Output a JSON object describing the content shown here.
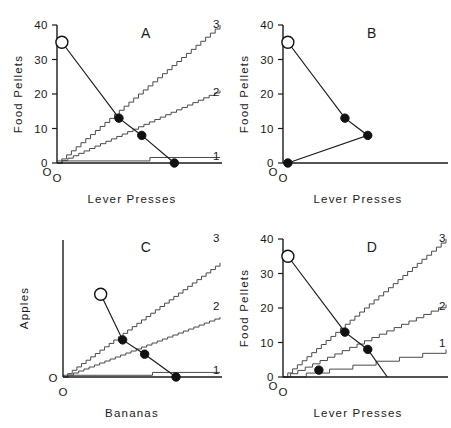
{
  "figure": {
    "colors": {
      "axis": "#1a1a1a",
      "schedule_line": "#4a4a4a",
      "demand_line": "#1a1a1a",
      "point_fill": "#111111",
      "point_open_fill": "#ffffff",
      "background": "#ffffff"
    }
  },
  "chart_data": [
    {
      "type": "line",
      "panel": "A",
      "title": "A",
      "xlabel": "Lever Presses",
      "ylabel": "Food Pellets",
      "yticks": [
        0,
        10,
        20,
        30,
        40
      ],
      "ylim": [
        0,
        40
      ],
      "xlim": [
        0,
        100
      ],
      "grid": false,
      "legend": "none",
      "origin_label": "O",
      "series": [
        {
          "name": "demand curve",
          "style": "line-with-markers",
          "x": [
            3,
            38,
            52,
            72
          ],
          "y": [
            35,
            13,
            8,
            0
          ],
          "markers": [
            "open",
            "filled",
            "filled",
            "filled"
          ]
        },
        {
          "name": "ratio schedule 3",
          "label": "3",
          "style": "staircase",
          "slope": 0.4,
          "x_end": 100,
          "y_end": 40
        },
        {
          "name": "ratio schedule 2",
          "label": "2",
          "style": "staircase",
          "slope": 0.21,
          "x_end": 100,
          "y_end": 19
        },
        {
          "name": "ratio schedule 1",
          "label": "1",
          "style": "staircase",
          "slope": 0.012,
          "x_end": 100,
          "y_end": 1
        }
      ]
    },
    {
      "type": "line",
      "panel": "B",
      "title": "B",
      "xlabel": "Lever Presses",
      "ylabel": "Food Pellets",
      "yticks": [
        0,
        10,
        20,
        30,
        40
      ],
      "ylim": [
        0,
        40
      ],
      "xlim": [
        0,
        100
      ],
      "grid": false,
      "legend": "none",
      "origin_label": "O",
      "series": [
        {
          "name": "demand curve",
          "style": "line-with-markers",
          "x": [
            3,
            38,
            52,
            3
          ],
          "y": [
            35,
            13,
            8,
            0
          ],
          "markers": [
            "open",
            "filled",
            "filled",
            "filled"
          ]
        }
      ]
    },
    {
      "type": "line",
      "panel": "C",
      "title": "C",
      "xlabel": "Bananas",
      "ylabel": "Apples",
      "yticks": [],
      "ylim": [
        0,
        48
      ],
      "xlim": [
        0,
        100
      ],
      "grid": false,
      "legend": "none",
      "origin_label": "O",
      "series": [
        {
          "name": "demand curve",
          "style": "line-with-markers",
          "x": [
            24,
            38,
            52,
            72
          ],
          "y": [
            29,
            13,
            8,
            0
          ],
          "markers": [
            "open",
            "filled",
            "filled",
            "filled"
          ]
        },
        {
          "name": "indifference schedule 3",
          "label": "3",
          "style": "staircase",
          "slope": 0.4,
          "x_end": 100,
          "y_end": 40
        },
        {
          "name": "indifference schedule 2",
          "label": "2",
          "style": "staircase",
          "slope": 0.21,
          "x_end": 100,
          "y_end": 19
        },
        {
          "name": "indifference schedule 1",
          "label": "1",
          "style": "staircase",
          "slope": 0.012,
          "x_end": 100,
          "y_end": 1
        }
      ]
    },
    {
      "type": "line",
      "panel": "D",
      "title": "D",
      "xlabel": "Lever Presses",
      "ylabel": "Food Pellets",
      "yticks": [
        0,
        10,
        20,
        30,
        40
      ],
      "ylim": [
        0,
        40
      ],
      "xlim": [
        0,
        100
      ],
      "grid": false,
      "legend": "none",
      "origin_label": "O",
      "series": [
        {
          "name": "demand curve",
          "style": "line-with-markers",
          "x": [
            3,
            38,
            52,
            64
          ],
          "y": [
            35,
            13,
            8,
            0
          ],
          "markers": [
            "open",
            "filled",
            "filled",
            "none"
          ]
        },
        {
          "name": "low-ratio point",
          "style": "marker-only",
          "x": [
            22
          ],
          "y": [
            2
          ],
          "markers": [
            "filled"
          ]
        },
        {
          "name": "ratio schedule 3",
          "label": "3",
          "style": "staircase",
          "slope": 0.4,
          "x_end": 100,
          "y_end": 40
        },
        {
          "name": "ratio schedule 2",
          "label": "2",
          "style": "staircase",
          "slope": 0.21,
          "x_end": 100,
          "y_end": 19
        },
        {
          "name": "ratio schedule 1",
          "label": "1",
          "style": "coarse-staircase",
          "slope": 0.08,
          "x_end": 100,
          "y_end": 8
        }
      ]
    }
  ],
  "panels": {
    "A": {
      "letter": "A",
      "xlabel": "Lever Presses",
      "ylabel": "Food Pellets",
      "origin": "O",
      "origin_axis": "O",
      "ticks": [
        "40",
        "30",
        "20",
        "10",
        "0"
      ],
      "schedule_labels": [
        "3",
        "2",
        "1"
      ]
    },
    "B": {
      "letter": "B",
      "xlabel": "Lever Presses",
      "ylabel": "Food Pellets",
      "origin": "O",
      "origin_axis": "O",
      "ticks": [
        "40",
        "30",
        "20",
        "10",
        "0"
      ],
      "schedule_labels": []
    },
    "C": {
      "letter": "C",
      "xlabel": "Bananas",
      "ylabel": "Apples",
      "origin": "O",
      "origin_axis": "O",
      "ticks": [],
      "schedule_labels": [
        "3",
        "2",
        "1"
      ]
    },
    "D": {
      "letter": "D",
      "xlabel": "Lever Presses",
      "ylabel": "Food Pellets",
      "origin": "O",
      "origin_axis": "O",
      "ticks": [
        "40",
        "30",
        "20",
        "10",
        "0"
      ],
      "schedule_labels": [
        "3",
        "2",
        "1"
      ]
    }
  }
}
